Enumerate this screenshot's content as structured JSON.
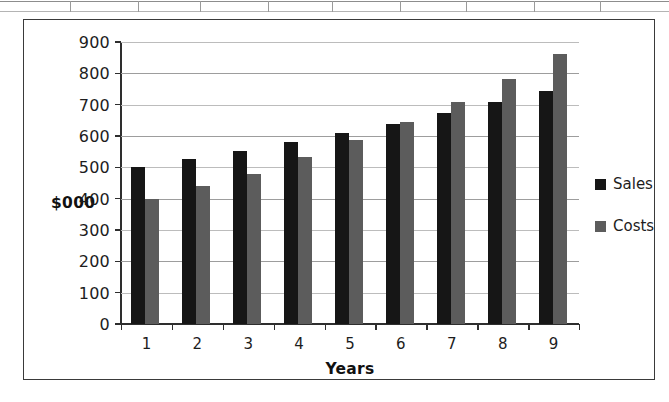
{
  "chart_data": {
    "type": "bar",
    "title": "",
    "subtitle": "",
    "xlabel": "Years",
    "ylabel": "$000",
    "categories": [
      "1",
      "2",
      "3",
      "4",
      "5",
      "6",
      "7",
      "8",
      "9"
    ],
    "series": [
      {
        "name": "Sales",
        "color": "#161616",
        "values": [
          500,
          528,
          553,
          580,
          610,
          637,
          675,
          707,
          743
        ]
      },
      {
        "name": "Costs",
        "color": "#5c5c5c",
        "values": [
          400,
          440,
          480,
          532,
          587,
          645,
          708,
          782,
          862
        ]
      }
    ],
    "ylim": [
      0,
      900
    ],
    "ytick_values": [
      0,
      100,
      200,
      300,
      400,
      500,
      600,
      700,
      800,
      900
    ],
    "ytick_labels": [
      "0",
      "100",
      "200",
      "300",
      "400",
      "500",
      "600",
      "700",
      "800",
      "900"
    ],
    "grid": true,
    "grid_axis": "y",
    "legend_position": "right",
    "legend_entries": [
      "Sales",
      "Costs"
    ]
  },
  "figure": {
    "border_color": "#3a3a3a",
    "background": "#ffffff",
    "axis_color": "#2e2e2e",
    "gridline_color": "#9d9d9d"
  },
  "scan_artifact": {
    "present": true,
    "description": "partial-table-rule"
  }
}
